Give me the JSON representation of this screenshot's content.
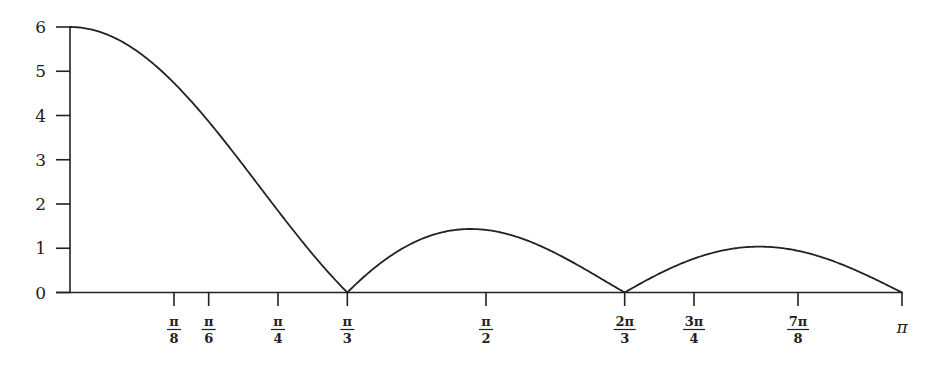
{
  "chart_data": {
    "type": "line",
    "title": "",
    "xlabel": "",
    "ylabel": "",
    "function_description": "|sin(3x) / sin(x/2)|",
    "xlim": [
      0,
      3.14159
    ],
    "ylim": [
      0,
      6
    ],
    "grid": false,
    "legend": null,
    "yticks": [
      0,
      1,
      2,
      3,
      4,
      5,
      6
    ],
    "ytick_labels": [
      "0",
      "1",
      "2",
      "3",
      "4",
      "5",
      "6"
    ],
    "xticks": [
      {
        "value": 0.3927,
        "num": "π",
        "den": "8"
      },
      {
        "value": 0.5236,
        "num": "π",
        "den": "6"
      },
      {
        "value": 0.7854,
        "num": "π",
        "den": "4"
      },
      {
        "value": 1.0472,
        "num": "π",
        "den": "3"
      },
      {
        "value": 1.5708,
        "num": "π",
        "den": "2"
      },
      {
        "value": 2.0944,
        "num": "2π",
        "den": "3"
      },
      {
        "value": 2.3562,
        "num": "3π",
        "den": "4"
      },
      {
        "value": 2.7489,
        "num": "7π",
        "den": "8"
      },
      {
        "value": 3.14159,
        "num": "π",
        "den": ""
      }
    ],
    "series": [
      {
        "name": "curve",
        "x": [
          0,
          0.3927,
          0.5236,
          0.7854,
          1.0472,
          1.3,
          1.5708,
          1.8,
          2.0944,
          2.3562,
          2.6,
          2.75,
          3.0,
          3.14159
        ],
        "values": [
          6.0,
          4.83,
          4.0,
          2.71,
          0.0,
          1.14,
          1.41,
          1.0,
          0.0,
          0.77,
          1.04,
          1.04,
          0.42,
          0.0
        ]
      }
    ],
    "key_points": {
      "max": {
        "x": 0,
        "y": 6
      },
      "zeros": [
        "π/3",
        "2π/3",
        "π"
      ],
      "local_max_1": {
        "x": "≈π/2",
        "y": 1.41
      },
      "local_max_2": {
        "x": "≈7π/8",
        "y": 1.05
      }
    }
  },
  "style": {
    "line_color": "#222222",
    "axis_color": "#222222"
  }
}
